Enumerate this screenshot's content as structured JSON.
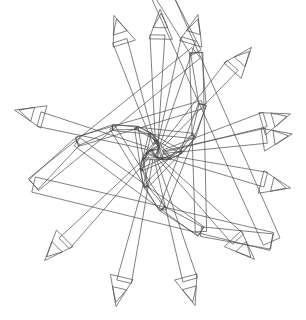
{
  "figure": {
    "title": "Recursive Triangle Spiral",
    "type": "line-art",
    "medium": "turtle-graphics vector drawing",
    "canvas": {
      "width": 306,
      "height": 320,
      "background_color": "#ffffff"
    },
    "stroke": {
      "color": "#4a4a4a",
      "width": 0.7,
      "fill": "none"
    },
    "center": {
      "x": 155,
      "y": 152
    },
    "symmetry": {
      "order": 3,
      "description": "three-fold rotational symmetry with spiral twist"
    },
    "bounds": {
      "left": 12,
      "top": 6,
      "right": 293,
      "bottom": 313
    },
    "spiral": {
      "iterations": 26,
      "sides": 3,
      "turn_per_side_degrees": 120,
      "extra_twist_degrees": 7.5,
      "start_radius": 172,
      "shrink_factor": 0.855,
      "band_width_ratio": 0.062,
      "description": "nested triangles shrinking toward center, each rotated slightly, drawn as thin double-line bands"
    },
    "arms": {
      "count": 12,
      "tip_style": "arrowhead",
      "tip_count": 12,
      "description": "long thin bands radiating from the center, each terminating in a folded arrowhead tip"
    },
    "tips": [
      {
        "id": "tip-n-left",
        "x": 112,
        "y": 16,
        "angle_deg": 256
      },
      {
        "id": "tip-n",
        "x": 158,
        "y": 9,
        "angle_deg": 270
      },
      {
        "id": "tip-n-right",
        "x": 196,
        "y": 14,
        "angle_deg": 284
      },
      {
        "id": "tip-ne-up",
        "x": 250,
        "y": 46,
        "angle_deg": 318
      },
      {
        "id": "tip-ne",
        "x": 290,
        "y": 112,
        "angle_deg": 347
      },
      {
        "id": "tip-e",
        "x": 292,
        "y": 132,
        "angle_deg": 4
      },
      {
        "id": "tip-se",
        "x": 291,
        "y": 186,
        "angle_deg": 28
      },
      {
        "id": "tip-se-low",
        "x": 256,
        "y": 258,
        "angle_deg": 58
      },
      {
        "id": "tip-s-right",
        "x": 197,
        "y": 305,
        "angle_deg": 86
      },
      {
        "id": "tip-s-left",
        "x": 118,
        "y": 307,
        "angle_deg": 100
      },
      {
        "id": "tip-sw",
        "x": 46,
        "y": 262,
        "angle_deg": 128
      },
      {
        "id": "tip-w",
        "x": 14,
        "y": 112,
        "angle_deg": 190
      }
    ]
  }
}
